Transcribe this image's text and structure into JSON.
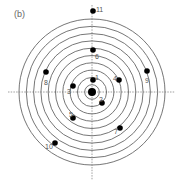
{
  "panel_label": "(b)",
  "target": {
    "center": [
      92,
      92
    ],
    "ring_count": 10,
    "ring_spacing": 7.3,
    "ring_color": "#666666"
  },
  "center_point": {
    "x": 92,
    "y": 92,
    "r": 4
  },
  "points": [
    {
      "id": "1",
      "x": 93,
      "y": 80,
      "lx": 95,
      "ly": 77
    },
    {
      "id": "2",
      "x": 102,
      "y": 103,
      "lx": 99,
      "ly": 99
    },
    {
      "id": "3",
      "x": 73,
      "y": 86,
      "lx": 67,
      "ly": 91
    },
    {
      "id": "4",
      "x": 119,
      "y": 80,
      "lx": 113,
      "ly": 78
    },
    {
      "id": "5",
      "x": 73,
      "y": 118,
      "lx": 69,
      "ly": 114
    },
    {
      "id": "6",
      "x": 93,
      "y": 50,
      "lx": 95,
      "ly": 56
    },
    {
      "id": "7",
      "x": 120,
      "y": 128,
      "lx": 114,
      "ly": 131
    },
    {
      "id": "8",
      "x": 46,
      "y": 72,
      "lx": 44,
      "ly": 82
    },
    {
      "id": "9",
      "x": 147,
      "y": 71,
      "lx": 145,
      "ly": 80
    },
    {
      "id": "10",
      "x": 55,
      "y": 143,
      "lx": 45,
      "ly": 146
    },
    {
      "id": "11",
      "x": 93,
      "y": 11,
      "lx": 96,
      "ly": 9
    }
  ]
}
